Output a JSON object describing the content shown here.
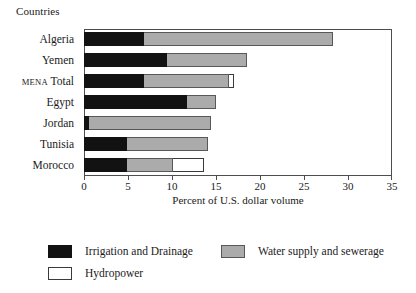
{
  "group_title": "Countries",
  "colors": {
    "irrigation": "#121212",
    "water": "#ababab",
    "hydropower": "#ffffff",
    "frame": "#4d4d4d",
    "text": "#1a1a1a"
  },
  "legend": {
    "items": [
      {
        "key": "irrigation",
        "label": "Irrigation and Drainage",
        "swatch": "irrigation-swatch"
      },
      {
        "key": "water",
        "label": "Water supply and sewerage",
        "swatch": "water-swatch"
      },
      {
        "key": "hydropower",
        "label": "Hydropower",
        "swatch": "hydropower-swatch"
      }
    ]
  },
  "chart_data": {
    "type": "bar",
    "orientation": "horizontal",
    "stacked": true,
    "title": "",
    "xlabel": "Percent of U.S. dollar volume",
    "ylabel": "Countries",
    "xlim": [
      0,
      35
    ],
    "xticks": [
      0,
      5,
      10,
      15,
      20,
      25,
      30,
      35
    ],
    "xtick_labels": [
      "0",
      "5",
      "10",
      "15",
      "20",
      "25",
      "30",
      "35"
    ],
    "grid": false,
    "legend_position": "bottom-left",
    "categories": [
      "Algeria",
      "Yemen",
      "MENA Total",
      "Egypt",
      "Jordan",
      "Tunisia",
      "Morocco"
    ],
    "category_labels": [
      {
        "text": "Algeria",
        "smallcaps_prefix": ""
      },
      {
        "text": "Yemen",
        "smallcaps_prefix": ""
      },
      {
        "text": "Total",
        "smallcaps_prefix": "MENA"
      },
      {
        "text": "Egypt",
        "smallcaps_prefix": ""
      },
      {
        "text": "Jordan",
        "smallcaps_prefix": ""
      },
      {
        "text": "Tunisia",
        "smallcaps_prefix": ""
      },
      {
        "text": "Morocco",
        "smallcaps_prefix": ""
      }
    ],
    "series": [
      {
        "name": "Irrigation and Drainage",
        "key": "irrigation",
        "values": [
          6.8,
          9.4,
          6.8,
          11.7,
          0.6,
          4.9,
          4.9
        ]
      },
      {
        "name": "Water supply and sewerage",
        "key": "water",
        "values": [
          21.5,
          9.1,
          9.7,
          3.3,
          13.8,
          9.2,
          5.2
        ]
      },
      {
        "name": "Hydropower",
        "key": "hydropower",
        "values": [
          0,
          0,
          0.5,
          0,
          0,
          0,
          3.5
        ]
      }
    ],
    "totals": [
      28.3,
      18.5,
      17.0,
      15.0,
      14.4,
      14.1,
      13.6
    ]
  }
}
